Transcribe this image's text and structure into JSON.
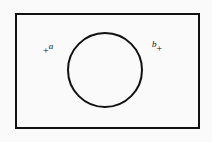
{
  "figure": {
    "background_color": "#fafafa",
    "stroke_color": "#111111",
    "width": 212,
    "height": 142,
    "caption": ""
  },
  "shapes": {
    "boundary_rectangle": {
      "name": "rectangle",
      "x": 15,
      "y": 13,
      "width": 184,
      "height": 115,
      "stroke_width": 2,
      "fill": "none"
    },
    "circle": {
      "name": "circle",
      "cx": 105,
      "cy": 70,
      "r": 37,
      "stroke_width": 2,
      "fill": "none"
    }
  },
  "labels": {
    "point_a": {
      "symbol": "a",
      "marker": "+",
      "x": 46,
      "y": 42
    },
    "point_b": {
      "symbol": "b",
      "marker": "+",
      "x": 156,
      "y": 40
    }
  },
  "chart_data": {
    "type": "diagram",
    "title": "",
    "elements": [
      {
        "kind": "rectangle",
        "label": "",
        "x": 15,
        "y": 13,
        "width": 184,
        "height": 115
      },
      {
        "kind": "circle",
        "label": "",
        "cx": 105,
        "cy": 70,
        "r": 37
      },
      {
        "kind": "point",
        "label": "a",
        "marker": "+",
        "x": 46,
        "y": 42
      },
      {
        "kind": "point",
        "label": "b",
        "marker": "+",
        "x": 156,
        "y": 40
      }
    ],
    "xlabel": "",
    "ylabel": ""
  }
}
